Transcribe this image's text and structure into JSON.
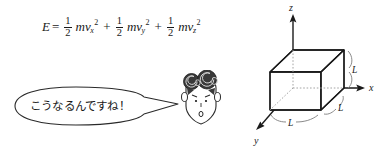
{
  "equation": {
    "lhs": "E",
    "equals": "=",
    "terms": [
      {
        "num": "1",
        "den": "2",
        "mass": "m",
        "vel": "v",
        "sub": "x",
        "sup": "2",
        "op": ""
      },
      {
        "num": "1",
        "den": "2",
        "mass": "m",
        "vel": "v",
        "sub": "y",
        "sup": "2",
        "op": "+"
      },
      {
        "num": "1",
        "den": "2",
        "mass": "m",
        "vel": "v",
        "sub": "z",
        "sup": "2",
        "op": "+"
      }
    ],
    "plain_text": "E = 1/2 mv_x^2 + 1/2 mv_y^2 + 1/2 mv_z^2"
  },
  "speech": {
    "text": "こうなるんですね！"
  },
  "character": {
    "name": "curly-haired-student-face"
  },
  "diagram": {
    "axes": [
      {
        "name": "z",
        "label": "z"
      },
      {
        "name": "x",
        "label": "x"
      },
      {
        "name": "y",
        "label": "y"
      }
    ],
    "dimensions": [
      {
        "name": "edge-right-vertical",
        "label": "L"
      },
      {
        "name": "edge-bottom-right",
        "label": "L"
      },
      {
        "name": "edge-bottom-front",
        "label": "L"
      }
    ]
  },
  "colors": {
    "ink": "#1a1a1a",
    "light_ink": "#8a8a8a",
    "background": "#ffffff"
  }
}
